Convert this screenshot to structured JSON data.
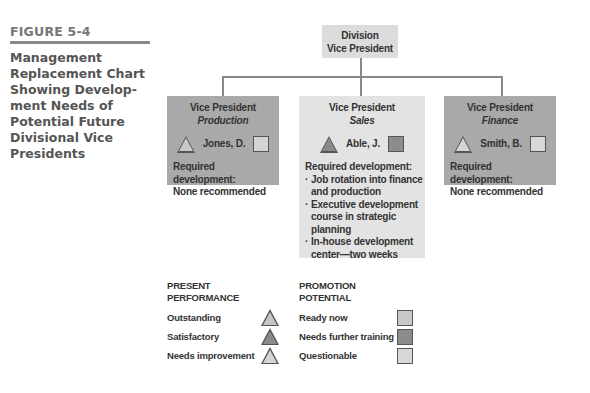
{
  "figure": {
    "label": "FIGURE 5-4"
  },
  "top": {
    "line1": "Division",
    "line2": "Vice President"
  },
  "positions": [
    {
      "title": "Vice President",
      "dept": "Production",
      "name": "Jones, D.",
      "performance": "Needs improvement",
      "potential": "Questionable",
      "dev_label": "Required development:",
      "dev_items": [
        "None recommended"
      ]
    },
    {
      "title": "Vice President",
      "dept": "Sales",
      "name": "Able, J.",
      "performance": "Satisfactory",
      "potential": "Needs further training",
      "dev_label": "Required development:",
      "dev_items": [
        "Job rotation into finance and production",
        "Executive development course in strategic planning",
        "In-house development center—two weeks"
      ]
    },
    {
      "title": "Vice President",
      "dept": "Finance",
      "name": "Smith, B.",
      "performance": "Needs improvement",
      "potential": "Questionable",
      "dev_label": "Required development:",
      "dev_items": [
        "None recommended"
      ]
    }
  ],
  "legend": {
    "performance": {
      "header1": "PRESENT",
      "header2": "PERFORMANCE",
      "items": [
        {
          "label": "Outstanding",
          "color": "#c4c4c4"
        },
        {
          "label": "Satisfactory",
          "color": "#8a8a8a"
        },
        {
          "label": "Needs improvement",
          "color": "#d4d4d4"
        }
      ]
    },
    "potential": {
      "header1": "PROMOTION",
      "header2": "POTENTIAL",
      "items": [
        {
          "label": "Ready now",
          "color": "#c8c8c8"
        },
        {
          "label": "Needs further training",
          "color": "#8c8c8c"
        },
        {
          "label": "Questionable",
          "color": "#d8d8d8"
        }
      ]
    }
  }
}
